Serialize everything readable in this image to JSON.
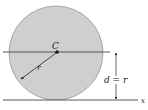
{
  "diagram": {
    "type": "cylinder-on-surface",
    "colors": {
      "disk_fill": "#cfcfcf",
      "disk_stroke": "#9a9a9a",
      "line": "#444444",
      "background": "#ffffff"
    },
    "labels": {
      "center": "C",
      "radius": "r",
      "distance": "d = r",
      "axis": "x"
    }
  }
}
